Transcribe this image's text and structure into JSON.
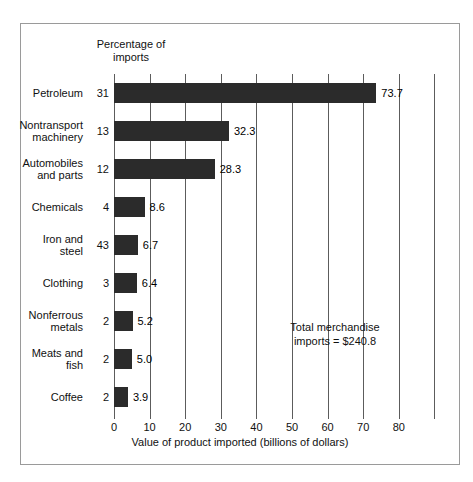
{
  "figure": {
    "percentage_header": "Percentage\nof imports",
    "annotation": "Total merchandise\nimports  =  $240.8"
  },
  "chart_data": {
    "type": "bar",
    "orientation": "horizontal",
    "title": "",
    "xlabel": "Value of product imported (billions of dollars)",
    "ylabel": "",
    "xlim": [
      0,
      92
    ],
    "xticks": [
      0,
      10,
      20,
      30,
      40,
      50,
      60,
      70,
      80
    ],
    "xtick_labels": [
      "0",
      "10",
      "20",
      "30",
      "40",
      "50",
      "60",
      "70",
      "80"
    ],
    "extra_gridlines": [
      90
    ],
    "grid": true,
    "legend": "none",
    "bar_color": "#2b2b2b",
    "categories": [
      "Petroleum",
      "Nontransport\nmachinery",
      "Automobiles\nand parts",
      "Chemicals",
      "Iron and steel",
      "Clothing",
      "Nonferrous\nmetals",
      "Meats and\nfish",
      "Coffee"
    ],
    "values": [
      73.7,
      32.3,
      28.3,
      8.6,
      6.7,
      6.4,
      5.2,
      5.0,
      3.9
    ],
    "value_labels": [
      "73.7",
      "32.3",
      "28.3",
      "8.6",
      "6.7",
      "6.4",
      "5.2",
      "5.0",
      "3.9"
    ],
    "percent_of_imports": [
      "31",
      "13",
      "12",
      "4",
      "43",
      "3",
      "2",
      "2",
      "2"
    ],
    "annotations": [
      {
        "text": "Total merchandise imports  =  $240.8",
        "x": 44,
        "y": 6.6
      }
    ]
  }
}
